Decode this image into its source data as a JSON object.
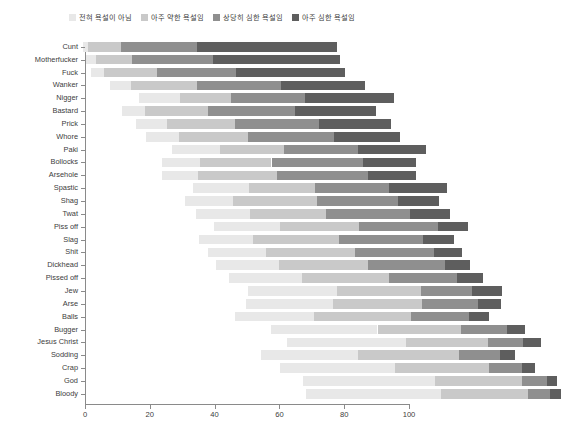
{
  "legend": {
    "position": "top-center",
    "items": [
      {
        "label": "전혀 욕설이 아님",
        "color": "#e8e8e8",
        "icon": "legend-swatch-icon"
      },
      {
        "label": "아주 약한 욕설임",
        "color": "#c9c9c9",
        "icon": "legend-swatch-icon"
      },
      {
        "label": "상당히 심한 욕설임",
        "color": "#8f8f8f",
        "icon": "legend-swatch-icon"
      },
      {
        "label": "아주 심한 욕설임",
        "color": "#5e5e5e",
        "icon": "legend-swatch-icon"
      }
    ]
  },
  "axis": {
    "x_ticks": [
      "0",
      "20",
      "40",
      "60",
      "80",
      "100"
    ]
  },
  "chart_data": {
    "type": "bar",
    "title": "",
    "subtitle": "",
    "xlabel": "",
    "ylabel": "",
    "orientation": "horizontal",
    "stacked": true,
    "diverging": true,
    "grid": false,
    "legend_position": "top-center",
    "xlim": [
      0,
      100
    ],
    "xticks": [
      0,
      20,
      40,
      60,
      80,
      100
    ],
    "categories": [
      "Cunt",
      "Motherfucker",
      "Fuck",
      "Wanker",
      "Nigger",
      "Bastard",
      "Prick",
      "Whore",
      "Paki",
      "Bollocks",
      "Arsehole",
      "Spastic",
      "Shag",
      "Twat",
      "Piss off",
      "Slag",
      "Shit",
      "Dickhead",
      "Pissed off",
      "Jew",
      "Arse",
      "Balls",
      "Bugger",
      "Jesus Christ",
      "Sodding",
      "Crap",
      "God",
      "Bloody"
    ],
    "series": [
      {
        "name": "전혀 욕설이 아님",
        "color": "#e8e8e8",
        "values": [
          2,
          4,
          5,
          8,
          16,
          9,
          12,
          13,
          19,
          15,
          14,
          22,
          19,
          21,
          26,
          21,
          23,
          25,
          29,
          35,
          34,
          31,
          42,
          47,
          38,
          45,
          52,
          53
        ]
      },
      {
        "name": "아주 약한 욕설임",
        "color": "#c9c9c9",
        "values": [
          13,
          14,
          21,
          26,
          20,
          25,
          27,
          27,
          25,
          28,
          31,
          26,
          33,
          30,
          31,
          34,
          35,
          35,
          34,
          33,
          35,
          38,
          33,
          32,
          40,
          37,
          34,
          34
        ]
      },
      {
        "name": "상당히 심한 욕설임",
        "color": "#8f8f8f",
        "values": [
          30,
          32,
          31,
          33,
          29,
          34,
          33,
          34,
          29,
          36,
          36,
          29,
          32,
          33,
          31,
          33,
          31,
          30,
          27,
          20,
          22,
          23,
          18,
          14,
          16,
          13,
          10,
          9
        ]
      },
      {
        "name": "아주 심한 욕설임",
        "color": "#5e5e5e",
        "values": [
          55,
          50,
          43,
          33,
          35,
          32,
          28,
          26,
          27,
          21,
          19,
          23,
          16,
          16,
          12,
          12,
          11,
          10,
          10,
          12,
          9,
          8,
          7,
          7,
          6,
          5,
          4,
          4
        ]
      }
    ],
    "row_offsets": [
      -2,
      0,
      3,
      15,
      33,
      22,
      31,
      37,
      53,
      47,
      47,
      66,
      61,
      68,
      79,
      70,
      75,
      80,
      88,
      100,
      99,
      92,
      114,
      124,
      108,
      120,
      134,
      136
    ]
  }
}
